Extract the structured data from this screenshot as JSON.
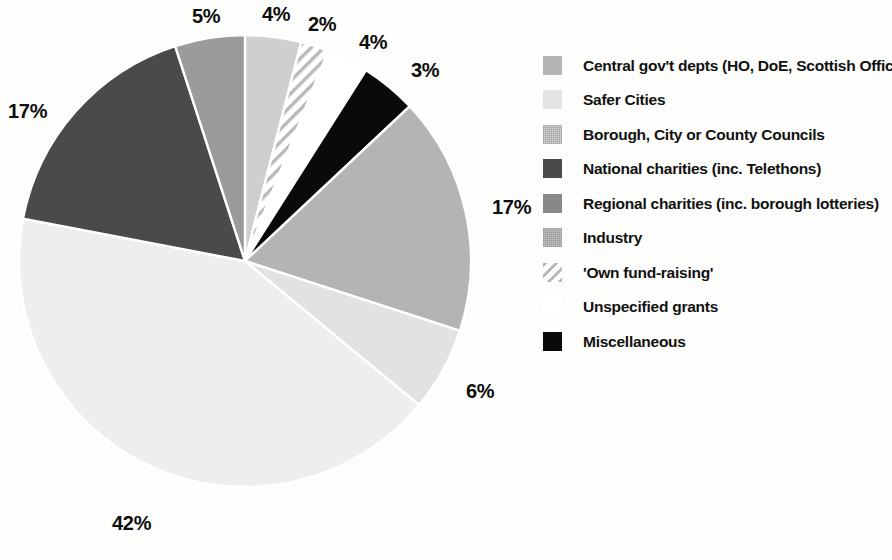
{
  "chart_data": {
    "type": "pie",
    "title": "",
    "subtitle": "",
    "xlabel": "",
    "ylabel": "",
    "legend_position": "right",
    "grid": false,
    "value_unit": "%",
    "start_angle_deg": 0,
    "direction": "clockwise",
    "categories": [
      "Safer Cities",
      "'Own fund-raising'",
      "Unspecified grants",
      "Miscellaneous",
      "Central gov't depts (HO, DoE, Scottish Office)",
      "Borough, City or County Councils",
      "Industry",
      "National charities (inc. Telethons)",
      "Regional charities (inc. borough lotteries)"
    ],
    "values": [
      4,
      2,
      3,
      4,
      17,
      6,
      42,
      17,
      5
    ],
    "data_labels": [
      "4%",
      "2%",
      "3%",
      "4%",
      "17%",
      "6%",
      "42%",
      "17%",
      "5%"
    ],
    "slices": [
      {
        "label": "Safer Cities",
        "value": 4,
        "data_label": "4%",
        "fill": "#cfcfcf",
        "pattern": "solid",
        "start_deg": 0,
        "end_deg": 14.4
      },
      {
        "label": "'Own fund-raising'",
        "value": 2,
        "data_label": "2%",
        "fill": "#ffffff",
        "pattern": "diagonal-hatch",
        "start_deg": 14.4,
        "end_deg": 21.6
      },
      {
        "label": "Unspecified grants",
        "value": 3,
        "data_label": "3%",
        "fill": "#ffffff",
        "pattern": "solid",
        "start_deg": 21.6,
        "end_deg": 32.4
      },
      {
        "label": "Miscellaneous",
        "value": 4,
        "data_label": "4%",
        "fill": "#0a0a0a",
        "pattern": "solid",
        "start_deg": 32.4,
        "end_deg": 46.8
      },
      {
        "label": "Central gov't depts (HO, DoE, Scottish Office)",
        "value": 17,
        "data_label": "17%",
        "fill": "#b4b4b4",
        "pattern": "solid",
        "start_deg": 46.8,
        "end_deg": 108.0
      },
      {
        "label": "Borough, City or County Councils",
        "value": 6,
        "data_label": "6%",
        "fill": "#e2e2e2",
        "pattern": "solid",
        "start_deg": 108.0,
        "end_deg": 129.6
      },
      {
        "label": "Industry",
        "value": 42,
        "data_label": "42%",
        "fill": "#eeeeee",
        "pattern": "solid",
        "start_deg": 129.6,
        "end_deg": 280.8
      },
      {
        "label": "National charities (inc. Telethons)",
        "value": 17,
        "data_label": "17%",
        "fill": "#4a4a4a",
        "pattern": "solid",
        "start_deg": 280.8,
        "end_deg": 342.0
      },
      {
        "label": "Regional charities (inc. borough lotteries)",
        "value": 5,
        "data_label": "5%",
        "fill": "#9b9b9b",
        "pattern": "solid",
        "start_deg": 342.0,
        "end_deg": 360.0
      }
    ]
  },
  "pie_labels": [
    {
      "name": "label-regional-5",
      "text": "5%",
      "left": 192,
      "top": 6
    },
    {
      "name": "label-safer-cities-4",
      "text": "4%",
      "left": 262,
      "top": 4
    },
    {
      "name": "label-own-fundraising-2",
      "text": "2%",
      "left": 308,
      "top": 14
    },
    {
      "name": "label-miscellaneous-4",
      "text": "4%",
      "left": 359,
      "top": 32
    },
    {
      "name": "label-unspecified-3",
      "text": "3%",
      "left": 411,
      "top": 60
    },
    {
      "name": "label-central-gov-17",
      "text": "17%",
      "left": 492,
      "top": 197
    },
    {
      "name": "label-borough-councils-6",
      "text": "6%",
      "left": 466,
      "top": 381
    },
    {
      "name": "label-industry-42",
      "text": "42%",
      "left": 112,
      "top": 513
    },
    {
      "name": "label-national-charities-17",
      "text": "17%",
      "left": 8,
      "top": 101
    }
  ],
  "legend": {
    "items": [
      {
        "label": "Central gov't depts (HO, DoE, Scottish Office)",
        "swatch_color": "#b4b4b4",
        "pattern": "solid",
        "icon": "color-swatch-icon"
      },
      {
        "label": "Safer Cities",
        "swatch_color": "#e4e4e4",
        "pattern": "solid",
        "icon": "color-swatch-icon"
      },
      {
        "label": "Borough, City or County Councils",
        "swatch_color": "#dcdcdc",
        "pattern": "dotted",
        "icon": "color-swatch-icon"
      },
      {
        "label": "National charities (inc. Telethons)",
        "swatch_color": "#4a4a4a",
        "pattern": "solid",
        "icon": "color-swatch-icon"
      },
      {
        "label": "Regional charities (inc. borough lotteries)",
        "swatch_color": "#888888",
        "pattern": "solid",
        "icon": "color-swatch-icon"
      },
      {
        "label": "Industry",
        "swatch_color": "#c4c4c4",
        "pattern": "dotted",
        "icon": "color-swatch-icon"
      },
      {
        "label": "'Own fund-raising'",
        "swatch_color": "#ffffff",
        "pattern": "diagonal-hatch",
        "icon": "hatch-swatch-icon"
      },
      {
        "label": "Unspecified grants",
        "swatch_color": "#ffffff",
        "pattern": "solid",
        "icon": "color-swatch-icon"
      },
      {
        "label": "Miscellaneous",
        "swatch_color": "#0a0a0a",
        "pattern": "solid",
        "icon": "color-swatch-icon"
      }
    ]
  }
}
